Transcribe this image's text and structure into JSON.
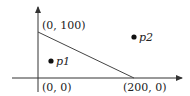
{
  "diagram": {
    "type": "feasible-region",
    "axes": {
      "x_axis": true,
      "y_axis": true
    },
    "line": {
      "from_label": "(0, 100)",
      "to_label": "(200, 0)"
    },
    "labels": {
      "origin": "(0, 0)",
      "y_intercept": "(0, 100)",
      "x_intercept": "(200, 0)"
    },
    "points": [
      {
        "name": "p1",
        "region": "below line"
      },
      {
        "name": "p2",
        "region": "above line"
      }
    ],
    "colors": {
      "stroke": "#333333",
      "text": "#222222"
    }
  }
}
